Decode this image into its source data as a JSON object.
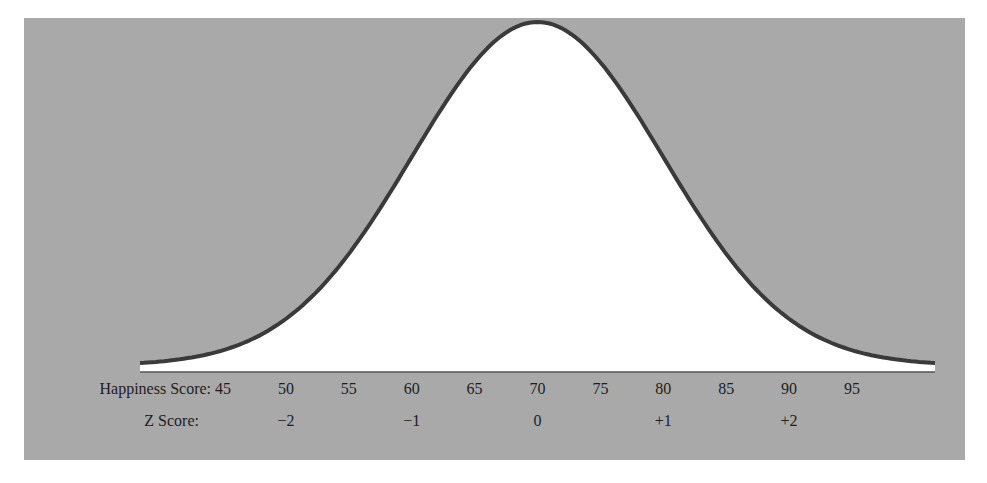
{
  "chart_data": {
    "type": "line",
    "title": "",
    "mean": 70,
    "sd": 10,
    "xlabel": "Happiness Score",
    "secondary_xlabel": "Z Score",
    "ylabel": "",
    "xlim": [
      42,
      99
    ],
    "grid": false,
    "legend": null,
    "x_ticks": [
      45,
      50,
      55,
      60,
      65,
      70,
      75,
      80,
      85,
      90,
      95
    ],
    "x_tick_labels": [
      "45",
      "50",
      "55",
      "60",
      "65",
      "70",
      "75",
      "80",
      "85",
      "90",
      "95"
    ],
    "z_ticks": [
      {
        "x": 50,
        "label": "−2"
      },
      {
        "x": 60,
        "label": "−1"
      },
      {
        "x": 70,
        "label": "0"
      },
      {
        "x": 80,
        "label": "+1"
      },
      {
        "x": 90,
        "label": "+2"
      }
    ],
    "series": [
      {
        "name": "normal curve",
        "x": [
          42,
          45,
          50,
          55,
          60,
          65,
          70,
          75,
          80,
          85,
          90,
          95,
          98
        ],
        "y_relative": [
          0.02,
          0.04,
          0.14,
          0.32,
          0.61,
          0.88,
          1.0,
          0.88,
          0.61,
          0.32,
          0.14,
          0.04,
          0.02
        ]
      }
    ],
    "colors": {
      "background_panel": "#a9a9a9",
      "curve_fill": "#ffffff",
      "curve_stroke": "#3a3a3a",
      "text": "#1e1e1e"
    }
  },
  "labels": {
    "happiness_row": "Happiness Score:",
    "z_row": "Z Score:"
  }
}
